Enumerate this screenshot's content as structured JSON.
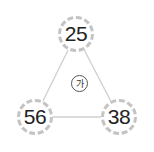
{
  "diagram": {
    "type": "triangle-of-circles",
    "nodes": [
      {
        "id": "top",
        "value": "25"
      },
      {
        "id": "bottom-left",
        "value": "56"
      },
      {
        "id": "bottom-right",
        "value": "38"
      }
    ],
    "center_label": "가",
    "colors": {
      "edge": "#c8c8c8",
      "node_border": "#c4c4c4",
      "text": "#222222"
    }
  }
}
